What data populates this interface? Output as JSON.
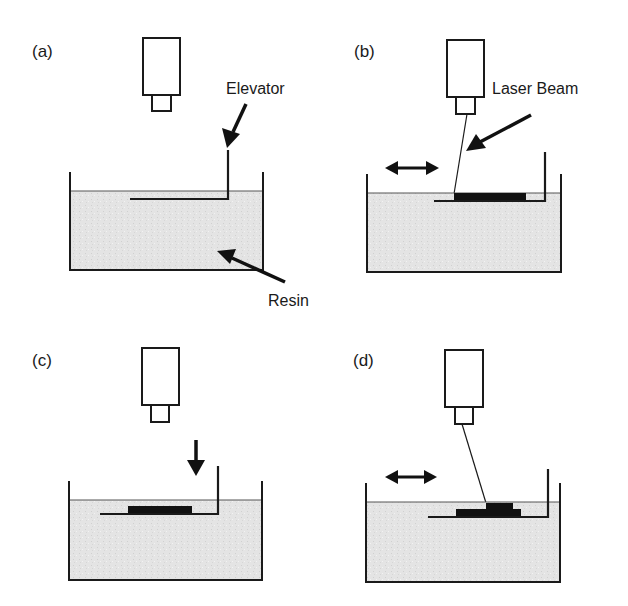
{
  "figure": {
    "panels": [
      {
        "id": "a",
        "label": "(a)",
        "step": "Initial: laser above resin vat, elevator platform just below resin surface"
      },
      {
        "id": "b",
        "label": "(b)",
        "step": "Laser beam scans and cures first layer on platform"
      },
      {
        "id": "c",
        "label": "(c)",
        "step": "Elevator lowers platform by one layer thickness"
      },
      {
        "id": "d",
        "label": "(d)",
        "step": "Laser cures next layer on top of previous layer"
      }
    ],
    "annotations": {
      "elevator": "Elevator",
      "resin": "Resin",
      "laser_beam": "Laser Beam"
    },
    "colors": {
      "line": "#1a1a1a",
      "resin_fill": "#e3e3e3",
      "cured_layer": "#111111",
      "background": "#ffffff"
    }
  }
}
